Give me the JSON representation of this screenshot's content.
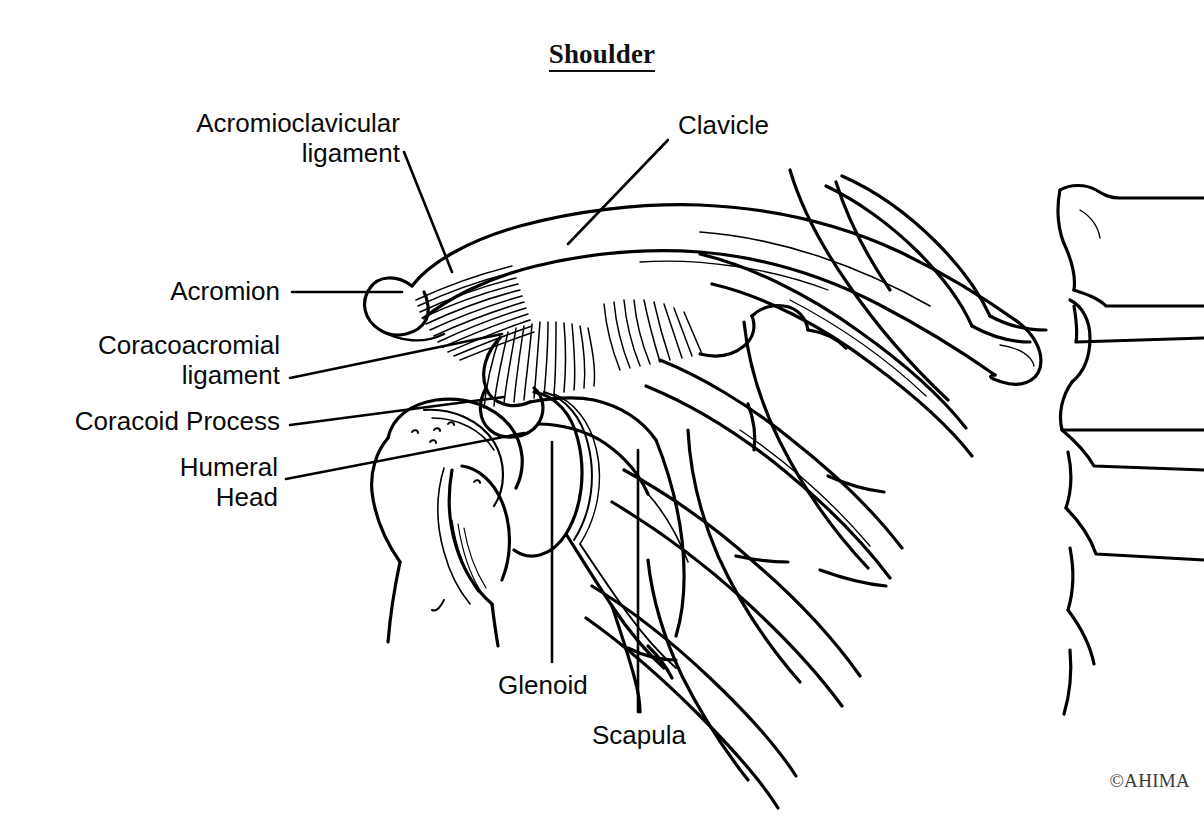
{
  "figure": {
    "title": "Shoulder",
    "credit": "©AHIMA",
    "background_color": "#ffffff",
    "ink_color": "#000000",
    "structures_drawn": [
      "clavicle",
      "acromion",
      "acromioclavicular ligament fibers",
      "coracoacromial ligament fibers",
      "coracoid process",
      "scapula with glenoid",
      "humeral head and proximal humerus",
      "ribs",
      "sternum and costal cartilages"
    ]
  },
  "labels": [
    {
      "id": "acromioclavicular-ligament",
      "text": "Acromioclavicular\nligament",
      "align": "right",
      "x": 172,
      "y": 108,
      "width": 228,
      "leader": {
        "type": "line",
        "x1": 404,
        "y1": 152,
        "x2": 452,
        "y2": 272
      }
    },
    {
      "id": "clavicle",
      "text": "Clavicle",
      "align": "left",
      "x": 678,
      "y": 110,
      "width": 160,
      "leader": {
        "type": "line",
        "x1": 668,
        "y1": 140,
        "x2": 568,
        "y2": 244
      }
    },
    {
      "id": "acromion",
      "text": "Acromion",
      "align": "right",
      "x": 158,
      "y": 276,
      "width": 122,
      "leader": {
        "type": "line",
        "x1": 292,
        "y1": 292,
        "x2": 402,
        "y2": 292
      }
    },
    {
      "id": "coracoacromial-ligament",
      "text": "Coracoacromial\nligament",
      "align": "right",
      "x": 84,
      "y": 330,
      "width": 196,
      "leader": {
        "type": "line",
        "x1": 290,
        "y1": 378,
        "x2": 502,
        "y2": 334
      }
    },
    {
      "id": "coracoid-process",
      "text": "Coracoid Process",
      "align": "right",
      "x": 62,
      "y": 406,
      "width": 218,
      "leader": {
        "type": "line",
        "x1": 290,
        "y1": 425,
        "x2": 504,
        "y2": 397
      }
    },
    {
      "id": "humeral-head",
      "text": "Humeral\nHead",
      "align": "right",
      "x": 120,
      "y": 452,
      "width": 158,
      "leader": {
        "type": "line",
        "x1": 286,
        "y1": 479,
        "x2": 524,
        "y2": 433
      }
    },
    {
      "id": "glenoid",
      "text": "Glenoid",
      "align": "left",
      "x": 498,
      "y": 670,
      "width": 140,
      "leader": {
        "type": "line",
        "x1": 552,
        "y1": 442,
        "x2": 552,
        "y2": 662
      }
    },
    {
      "id": "scapula",
      "text": "Scapula",
      "align": "left",
      "x": 592,
      "y": 720,
      "width": 140,
      "leader": {
        "type": "line",
        "x1": 638,
        "y1": 450,
        "x2": 638,
        "y2": 712
      }
    }
  ]
}
